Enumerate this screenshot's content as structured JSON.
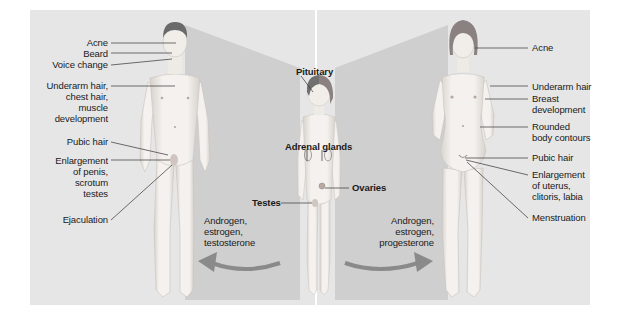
{
  "diagram": {
    "colors": {
      "page_bg": "#ffffff",
      "panel_bg": "#e6e6e6",
      "beam": "#c9c9c9",
      "arrow": "#8a8a8a",
      "skin": "#f2efec",
      "skin_shadow": "#d9d4cf",
      "hair_male": "#6a6a6a",
      "hair_female": "#8a8180",
      "leader_line": "#333333",
      "divider": "#ffffff"
    },
    "male": {
      "labels": [
        {
          "id": "acne",
          "text": "Acne"
        },
        {
          "id": "beard",
          "text": "Beard"
        },
        {
          "id": "voice",
          "text": "Voice change"
        },
        {
          "id": "underarm",
          "lines": [
            "Underarm hair,",
            "chest hair,",
            "muscle",
            "development"
          ]
        },
        {
          "id": "pubic",
          "text": "Pubic hair"
        },
        {
          "id": "enlargement",
          "lines": [
            "Enlargement",
            "of penis,",
            "scrotum",
            "testes"
          ]
        },
        {
          "id": "ejaculation",
          "text": "Ejaculation"
        }
      ],
      "hormones": [
        "Androgen,",
        "estrogen,",
        "testosterone"
      ]
    },
    "child": {
      "labels": {
        "pituitary": "Pituitary",
        "adrenal": "Adrenal glands",
        "testes": "Testes",
        "ovaries": "Ovaries"
      }
    },
    "female": {
      "labels": [
        {
          "id": "acne",
          "text": "Acne"
        },
        {
          "id": "underarm",
          "text": "Underarm hair"
        },
        {
          "id": "breast",
          "lines": [
            "Breast",
            "development"
          ]
        },
        {
          "id": "rounded",
          "lines": [
            "Rounded",
            "body contours"
          ]
        },
        {
          "id": "pubic",
          "text": "Pubic hair"
        },
        {
          "id": "enlargement",
          "lines": [
            "Enlargement",
            "of uterus,",
            "clitoris, labia"
          ]
        },
        {
          "id": "menstruation",
          "text": "Menstruation"
        }
      ],
      "hormones": [
        "Androgen,",
        "estrogen,",
        "progesterone"
      ]
    }
  }
}
